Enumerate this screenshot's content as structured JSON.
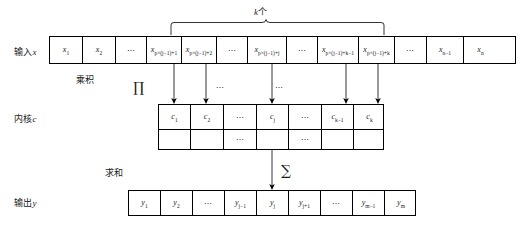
{
  "diagram": {
    "title_brace": {
      "label": "k个",
      "var": "k",
      "suffix": "个"
    },
    "rows": {
      "input": {
        "label_cn": "输入",
        "label_var": "x",
        "cells": [
          {
            "text": "x",
            "sub": "1",
            "kind": "math"
          },
          {
            "text": "x",
            "sub": "2",
            "kind": "math"
          },
          {
            "text": "⋯",
            "kind": "dots"
          },
          {
            "text": "x",
            "sub": "p×(j−1)+1",
            "kind": "math"
          },
          {
            "text": "x",
            "sub": "p×(j−1)+2",
            "kind": "math"
          },
          {
            "text": "⋯",
            "kind": "dots"
          },
          {
            "text": "x",
            "sub": "p×(j−1)+j",
            "kind": "math"
          },
          {
            "text": "⋯",
            "kind": "dots"
          },
          {
            "text": "x",
            "sub": "p×(j−1)+k−1",
            "kind": "math"
          },
          {
            "text": "x",
            "sub": "p×(j−1)+k",
            "kind": "math"
          },
          {
            "text": "⋯",
            "kind": "dots"
          },
          {
            "text": "x",
            "sub": "n−1",
            "kind": "math"
          },
          {
            "text": "x",
            "sub": "n",
            "kind": "math"
          }
        ]
      },
      "kernel": {
        "label_cn": "内核",
        "label_var": "c",
        "cells": [
          {
            "text": "c",
            "sub": "1",
            "kind": "math"
          },
          {
            "text": "c",
            "sub": "2",
            "kind": "math"
          },
          {
            "text": "⋯",
            "kind": "dots"
          },
          {
            "text": "c",
            "sub": "j",
            "kind": "math"
          },
          {
            "text": "⋯",
            "kind": "dots"
          },
          {
            "text": "c",
            "sub": "k−1",
            "kind": "math"
          },
          {
            "text": "c",
            "sub": "k",
            "kind": "math"
          }
        ],
        "subrow_cells": [
          {
            "text": "",
            "kind": "blank"
          },
          {
            "text": "",
            "kind": "blank"
          },
          {
            "text": "⋯",
            "kind": "dots"
          },
          {
            "text": "",
            "kind": "blank"
          },
          {
            "text": "⋯",
            "kind": "dots"
          },
          {
            "text": "",
            "kind": "blank"
          },
          {
            "text": "",
            "kind": "blank"
          }
        ]
      },
      "output": {
        "label_cn": "输出",
        "label_var": "y",
        "cells": [
          {
            "text": "y",
            "sub": "1",
            "kind": "math"
          },
          {
            "text": "y",
            "sub": "2",
            "kind": "math"
          },
          {
            "text": "⋯",
            "kind": "dots"
          },
          {
            "text": "y",
            "sub": "j−1",
            "kind": "math"
          },
          {
            "text": "y",
            "sub": "j",
            "kind": "math"
          },
          {
            "text": "y",
            "sub": "j+1",
            "kind": "math"
          },
          {
            "text": "⋯",
            "kind": "dots"
          },
          {
            "text": "y",
            "sub": "m−1",
            "kind": "math"
          },
          {
            "text": "y",
            "sub": "m",
            "kind": "math"
          }
        ]
      }
    },
    "operations": {
      "product": {
        "label": "乘积",
        "symbol": "∏"
      },
      "sum": {
        "label": "求和",
        "symbol": "∑"
      }
    },
    "ellipses_between": [
      "⋯",
      "⋯"
    ],
    "colors": {
      "stroke": "#000000",
      "background": "#ffffff",
      "text": "#1a1a1a"
    }
  }
}
